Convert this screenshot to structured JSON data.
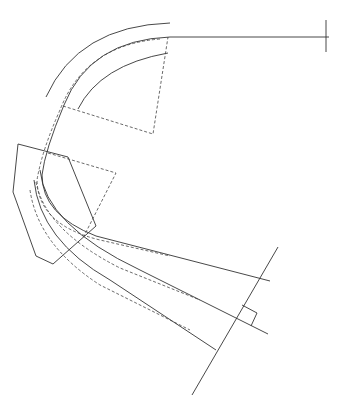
{
  "diagram": {
    "type": "technical-line-drawing",
    "colors": {
      "background": "#ffffff",
      "line": "#333333",
      "dashed": "#444444"
    },
    "paths": {
      "outer_arc": "M 46 97 Q 78 26 170 23",
      "main_track": "M 329 37 L 170 37 Q 90 40 64 105 Q 45 150 42 175 Q 42 215 96 236 L 270 281",
      "dashed_track": "M 160 39 Q 85 45 60 110 Q 42 150 37 180 Q 38 225 100 240 L 170 256",
      "inner_arc": "M 78 109 Q 100 65 168 53",
      "dashed_quad_top": "M 63 106 L 153 134 L 168 37",
      "polygon": "M 18 144 L 13 192 L 36 256 L 53 264 L 96 226 L 68 157 Z",
      "dashed_quad_mid": "M 48 153 L 116 173 L 84 236",
      "track_b": "M 40 170 Q 45 225 140 270 L 238 319",
      "track_b_dash": "M 36 182 Q 45 230 120 268 L 200 300",
      "track_c": "M 34 180 Q 40 240 110 280 L 216 350",
      "track_c_dash": "M 30 190 Q 38 245 100 285 L 190 330",
      "section_line": "M 278 247 L 192 395",
      "end_line_b": "M 238 319 L 268 334",
      "marker_box": "M 242 305 L 257 313 L 251 326",
      "end_tick": "M 326 20 L 326 52"
    }
  }
}
